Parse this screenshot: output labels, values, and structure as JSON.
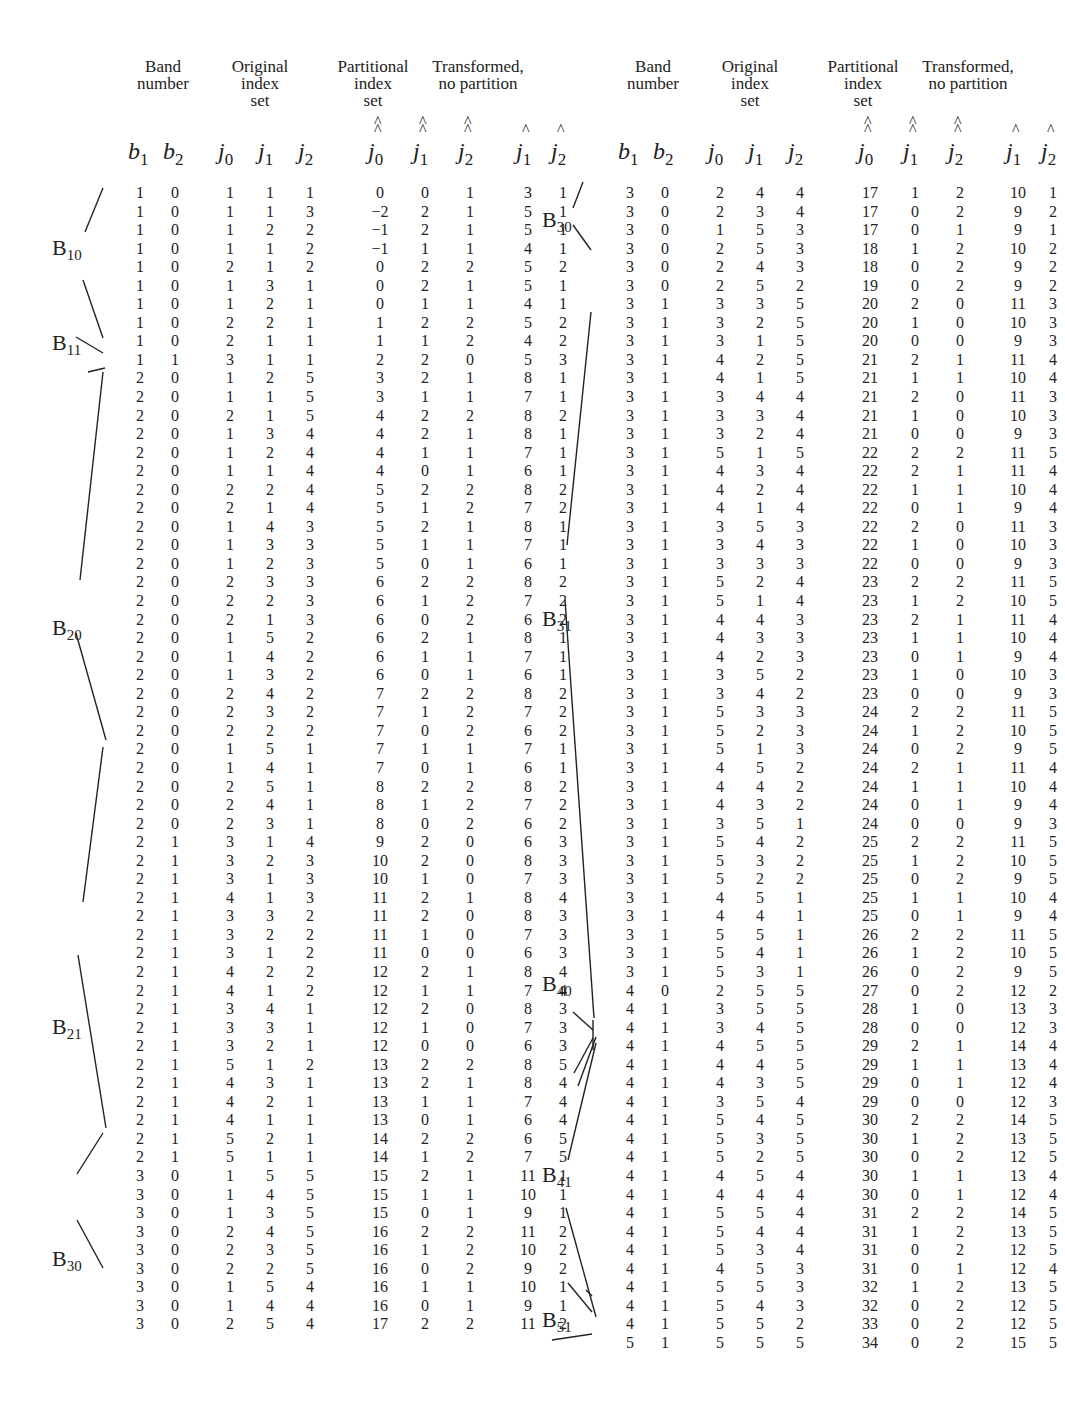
{
  "headers": {
    "band": "Band\nnumber",
    "original": "Original\nindex\nset",
    "partitional": "Partitional\nindex\nset",
    "transformed": "Transformed,\nno partition",
    "cols": [
      "b1",
      "b2",
      "j0",
      "j1",
      "j2",
      "ĵ̂0",
      "ĵ̂1",
      "ĵ̂2",
      "ĵ1",
      "ĵ2"
    ]
  },
  "left": {
    "bands": [
      {
        "label": "B",
        "sub": "10",
        "row": 3.5
      },
      {
        "label": "B",
        "sub": "11",
        "row": 8.6
      },
      {
        "label": "B",
        "sub": "20",
        "row": 24
      },
      {
        "label": "B",
        "sub": "21",
        "row": 45.5
      },
      {
        "label": "B",
        "sub": "30",
        "row": 58
      }
    ],
    "rows": [
      [
        1,
        0,
        1,
        1,
        1,
        0,
        0,
        1,
        3,
        1
      ],
      [
        1,
        0,
        1,
        1,
        3,
        -2,
        2,
        1,
        5,
        1
      ],
      [
        1,
        0,
        1,
        2,
        2,
        -1,
        2,
        1,
        5,
        1
      ],
      [
        1,
        0,
        1,
        1,
        2,
        -1,
        1,
        1,
        4,
        1
      ],
      [
        1,
        0,
        2,
        1,
        2,
        0,
        2,
        2,
        5,
        2
      ],
      [
        1,
        0,
        1,
        3,
        1,
        0,
        2,
        1,
        5,
        1
      ],
      [
        1,
        0,
        1,
        2,
        1,
        0,
        1,
        1,
        4,
        1
      ],
      [
        1,
        0,
        2,
        2,
        1,
        1,
        2,
        2,
        5,
        2
      ],
      [
        1,
        0,
        2,
        1,
        1,
        1,
        1,
        2,
        4,
        2
      ],
      [
        1,
        1,
        3,
        1,
        1,
        2,
        2,
        0,
        5,
        3
      ],
      [
        2,
        0,
        1,
        2,
        5,
        3,
        2,
        1,
        8,
        1
      ],
      [
        2,
        0,
        1,
        1,
        5,
        3,
        1,
        1,
        7,
        1
      ],
      [
        2,
        0,
        2,
        1,
        5,
        4,
        2,
        2,
        8,
        2
      ],
      [
        2,
        0,
        1,
        3,
        4,
        4,
        2,
        1,
        8,
        1
      ],
      [
        2,
        0,
        1,
        2,
        4,
        4,
        1,
        1,
        7,
        1
      ],
      [
        2,
        0,
        1,
        1,
        4,
        4,
        0,
        1,
        6,
        1
      ],
      [
        2,
        0,
        2,
        2,
        4,
        5,
        2,
        2,
        8,
        2
      ],
      [
        2,
        0,
        2,
        1,
        4,
        5,
        1,
        2,
        7,
        2
      ],
      [
        2,
        0,
        1,
        4,
        3,
        5,
        2,
        1,
        8,
        1
      ],
      [
        2,
        0,
        1,
        3,
        3,
        5,
        1,
        1,
        7,
        1
      ],
      [
        2,
        0,
        1,
        2,
        3,
        5,
        0,
        1,
        6,
        1
      ],
      [
        2,
        0,
        2,
        3,
        3,
        6,
        2,
        2,
        8,
        2
      ],
      [
        2,
        0,
        2,
        2,
        3,
        6,
        1,
        2,
        7,
        2
      ],
      [
        2,
        0,
        2,
        1,
        3,
        6,
        0,
        2,
        6,
        2
      ],
      [
        2,
        0,
        1,
        5,
        2,
        6,
        2,
        1,
        8,
        1
      ],
      [
        2,
        0,
        1,
        4,
        2,
        6,
        1,
        1,
        7,
        1
      ],
      [
        2,
        0,
        1,
        3,
        2,
        6,
        0,
        1,
        6,
        1
      ],
      [
        2,
        0,
        2,
        4,
        2,
        7,
        2,
        2,
        8,
        2
      ],
      [
        2,
        0,
        2,
        3,
        2,
        7,
        1,
        2,
        7,
        2
      ],
      [
        2,
        0,
        2,
        2,
        2,
        7,
        0,
        2,
        6,
        2
      ],
      [
        2,
        0,
        1,
        5,
        1,
        7,
        1,
        1,
        7,
        1
      ],
      [
        2,
        0,
        1,
        4,
        1,
        7,
        0,
        1,
        6,
        1
      ],
      [
        2,
        0,
        2,
        5,
        1,
        8,
        2,
        2,
        8,
        2
      ],
      [
        2,
        0,
        2,
        4,
        1,
        8,
        1,
        2,
        7,
        2
      ],
      [
        2,
        0,
        2,
        3,
        1,
        8,
        0,
        2,
        6,
        2
      ],
      [
        2,
        1,
        3,
        1,
        4,
        9,
        2,
        0,
        6,
        3
      ],
      [
        2,
        1,
        3,
        2,
        3,
        10,
        2,
        0,
        8,
        3
      ],
      [
        2,
        1,
        3,
        1,
        3,
        10,
        1,
        0,
        7,
        3
      ],
      [
        2,
        1,
        4,
        1,
        3,
        11,
        2,
        1,
        8,
        4
      ],
      [
        2,
        1,
        3,
        3,
        2,
        11,
        2,
        0,
        8,
        3
      ],
      [
        2,
        1,
        3,
        2,
        2,
        11,
        1,
        0,
        7,
        3
      ],
      [
        2,
        1,
        3,
        1,
        2,
        11,
        0,
        0,
        6,
        3
      ],
      [
        2,
        1,
        4,
        2,
        2,
        12,
        2,
        1,
        8,
        4
      ],
      [
        2,
        1,
        4,
        1,
        2,
        12,
        1,
        1,
        7,
        4
      ],
      [
        2,
        1,
        3,
        4,
        1,
        12,
        2,
        0,
        8,
        3
      ],
      [
        2,
        1,
        3,
        3,
        1,
        12,
        1,
        0,
        7,
        3
      ],
      [
        2,
        1,
        3,
        2,
        1,
        12,
        0,
        0,
        6,
        3
      ],
      [
        2,
        1,
        5,
        1,
        2,
        13,
        2,
        2,
        8,
        5
      ],
      [
        2,
        1,
        4,
        3,
        1,
        13,
        2,
        1,
        8,
        4
      ],
      [
        2,
        1,
        4,
        2,
        1,
        13,
        1,
        1,
        7,
        4
      ],
      [
        2,
        1,
        4,
        1,
        1,
        13,
        0,
        1,
        6,
        4
      ],
      [
        2,
        1,
        5,
        2,
        1,
        14,
        2,
        2,
        6,
        5
      ],
      [
        2,
        1,
        5,
        1,
        1,
        14,
        1,
        2,
        7,
        5
      ],
      [
        3,
        0,
        1,
        5,
        5,
        15,
        2,
        1,
        11,
        1
      ],
      [
        3,
        0,
        1,
        4,
        5,
        15,
        1,
        1,
        10,
        1
      ],
      [
        3,
        0,
        1,
        3,
        5,
        15,
        0,
        1,
        9,
        1
      ],
      [
        3,
        0,
        2,
        4,
        5,
        16,
        2,
        2,
        11,
        2
      ],
      [
        3,
        0,
        2,
        3,
        5,
        16,
        1,
        2,
        10,
        2
      ],
      [
        3,
        0,
        2,
        2,
        5,
        16,
        0,
        2,
        9,
        2
      ],
      [
        3,
        0,
        1,
        5,
        4,
        16,
        1,
        1,
        10,
        1
      ],
      [
        3,
        0,
        1,
        4,
        4,
        16,
        0,
        1,
        9,
        1
      ],
      [
        3,
        0,
        2,
        5,
        4,
        17,
        2,
        2,
        11,
        2
      ]
    ]
  },
  "right": {
    "bands": [
      {
        "label": "B",
        "sub": "30",
        "row": 2
      },
      {
        "label": "B",
        "sub": "31",
        "row": 23.5
      },
      {
        "label": "B",
        "sub": "40",
        "row": 43.2
      },
      {
        "label": "B",
        "sub": "41",
        "row": 53.5
      },
      {
        "label": "B",
        "sub": "51",
        "row": 61.3
      }
    ],
    "rows": [
      [
        3,
        0,
        2,
        4,
        4,
        17,
        1,
        2,
        10,
        1
      ],
      [
        3,
        0,
        2,
        3,
        4,
        17,
        0,
        2,
        9,
        2
      ],
      [
        3,
        0,
        1,
        5,
        3,
        17,
        0,
        1,
        9,
        1
      ],
      [
        3,
        0,
        2,
        5,
        3,
        18,
        1,
        2,
        10,
        2
      ],
      [
        3,
        0,
        2,
        4,
        3,
        18,
        0,
        2,
        9,
        2
      ],
      [
        3,
        0,
        2,
        5,
        2,
        19,
        0,
        2,
        9,
        2
      ],
      [
        3,
        1,
        3,
        3,
        5,
        20,
        2,
        0,
        11,
        3
      ],
      [
        3,
        1,
        3,
        2,
        5,
        20,
        1,
        0,
        10,
        3
      ],
      [
        3,
        1,
        3,
        1,
        5,
        20,
        0,
        0,
        9,
        3
      ],
      [
        3,
        1,
        4,
        2,
        5,
        21,
        2,
        1,
        11,
        4
      ],
      [
        3,
        1,
        4,
        1,
        5,
        21,
        1,
        1,
        10,
        4
      ],
      [
        3,
        1,
        3,
        4,
        4,
        21,
        2,
        0,
        11,
        3
      ],
      [
        3,
        1,
        3,
        3,
        4,
        21,
        1,
        0,
        10,
        3
      ],
      [
        3,
        1,
        3,
        2,
        4,
        21,
        0,
        0,
        9,
        3
      ],
      [
        3,
        1,
        5,
        1,
        5,
        22,
        2,
        2,
        11,
        5
      ],
      [
        3,
        1,
        4,
        3,
        4,
        22,
        2,
        1,
        11,
        4
      ],
      [
        3,
        1,
        4,
        2,
        4,
        22,
        1,
        1,
        10,
        4
      ],
      [
        3,
        1,
        4,
        1,
        4,
        22,
        0,
        1,
        9,
        4
      ],
      [
        3,
        1,
        3,
        5,
        3,
        22,
        2,
        0,
        11,
        3
      ],
      [
        3,
        1,
        3,
        4,
        3,
        22,
        1,
        0,
        10,
        3
      ],
      [
        3,
        1,
        3,
        3,
        3,
        22,
        0,
        0,
        9,
        3
      ],
      [
        3,
        1,
        5,
        2,
        4,
        23,
        2,
        2,
        11,
        5
      ],
      [
        3,
        1,
        5,
        1,
        4,
        23,
        1,
        2,
        10,
        5
      ],
      [
        3,
        1,
        4,
        4,
        3,
        23,
        2,
        1,
        11,
        4
      ],
      [
        3,
        1,
        4,
        3,
        3,
        23,
        1,
        1,
        10,
        4
      ],
      [
        3,
        1,
        4,
        2,
        3,
        23,
        0,
        1,
        9,
        4
      ],
      [
        3,
        1,
        3,
        5,
        2,
        23,
        1,
        0,
        10,
        3
      ],
      [
        3,
        1,
        3,
        4,
        2,
        23,
        0,
        0,
        9,
        3
      ],
      [
        3,
        1,
        5,
        3,
        3,
        24,
        2,
        2,
        11,
        5
      ],
      [
        3,
        1,
        5,
        2,
        3,
        24,
        1,
        2,
        10,
        5
      ],
      [
        3,
        1,
        5,
        1,
        3,
        24,
        0,
        2,
        9,
        5
      ],
      [
        3,
        1,
        4,
        5,
        2,
        24,
        2,
        1,
        11,
        4
      ],
      [
        3,
        1,
        4,
        4,
        2,
        24,
        1,
        1,
        10,
        4
      ],
      [
        3,
        1,
        4,
        3,
        2,
        24,
        0,
        1,
        9,
        4
      ],
      [
        3,
        1,
        3,
        5,
        1,
        24,
        0,
        0,
        9,
        3
      ],
      [
        3,
        1,
        5,
        4,
        2,
        25,
        2,
        2,
        11,
        5
      ],
      [
        3,
        1,
        5,
        3,
        2,
        25,
        1,
        2,
        10,
        5
      ],
      [
        3,
        1,
        5,
        2,
        2,
        25,
        0,
        2,
        9,
        5
      ],
      [
        3,
        1,
        4,
        5,
        1,
        25,
        1,
        1,
        10,
        4
      ],
      [
        3,
        1,
        4,
        4,
        1,
        25,
        0,
        1,
        9,
        4
      ],
      [
        3,
        1,
        5,
        5,
        1,
        26,
        2,
        2,
        11,
        5
      ],
      [
        3,
        1,
        5,
        4,
        1,
        26,
        1,
        2,
        10,
        5
      ],
      [
        3,
        1,
        5,
        3,
        1,
        26,
        0,
        2,
        9,
        5
      ],
      [
        4,
        0,
        2,
        5,
        5,
        27,
        0,
        2,
        12,
        2
      ],
      [
        4,
        1,
        3,
        5,
        5,
        28,
        1,
        0,
        13,
        3
      ],
      [
        4,
        1,
        3,
        4,
        5,
        28,
        0,
        0,
        12,
        3
      ],
      [
        4,
        1,
        4,
        5,
        5,
        29,
        2,
        1,
        14,
        4
      ],
      [
        4,
        1,
        4,
        4,
        5,
        29,
        1,
        1,
        13,
        4
      ],
      [
        4,
        1,
        4,
        3,
        5,
        29,
        0,
        1,
        12,
        4
      ],
      [
        4,
        1,
        3,
        5,
        4,
        29,
        0,
        0,
        12,
        3
      ],
      [
        4,
        1,
        5,
        4,
        5,
        30,
        2,
        2,
        14,
        5
      ],
      [
        4,
        1,
        5,
        3,
        5,
        30,
        1,
        2,
        13,
        5
      ],
      [
        4,
        1,
        5,
        2,
        5,
        30,
        0,
        2,
        12,
        5
      ],
      [
        4,
        1,
        4,
        5,
        4,
        30,
        1,
        1,
        13,
        4
      ],
      [
        4,
        1,
        4,
        4,
        4,
        30,
        0,
        1,
        12,
        4
      ],
      [
        4,
        1,
        5,
        5,
        4,
        31,
        2,
        2,
        14,
        5
      ],
      [
        4,
        1,
        5,
        4,
        4,
        31,
        1,
        2,
        13,
        5
      ],
      [
        4,
        1,
        5,
        3,
        4,
        31,
        0,
        2,
        12,
        5
      ],
      [
        4,
        1,
        4,
        5,
        3,
        31,
        0,
        1,
        12,
        4
      ],
      [
        4,
        1,
        5,
        5,
        3,
        32,
        1,
        2,
        13,
        5
      ],
      [
        4,
        1,
        5,
        4,
        3,
        32,
        0,
        2,
        12,
        5
      ],
      [
        4,
        1,
        5,
        5,
        2,
        33,
        0,
        2,
        12,
        5
      ],
      [
        5,
        1,
        5,
        5,
        5,
        34,
        0,
        2,
        15,
        5
      ]
    ]
  }
}
